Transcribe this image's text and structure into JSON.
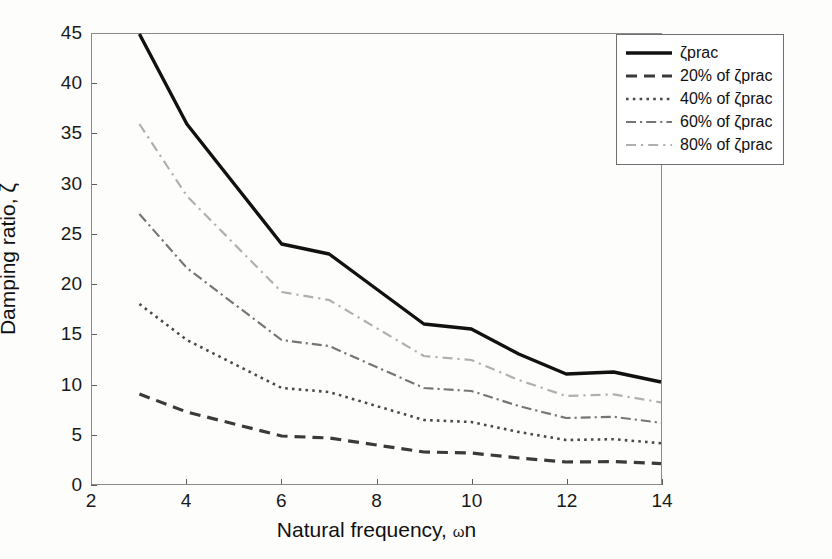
{
  "chart_data": {
    "type": "line",
    "title": "",
    "xlabel": "Natural frequency, ωn",
    "ylabel": "Damping ratio, ζ",
    "xlim": [
      2,
      14
    ],
    "ylim": [
      0,
      45
    ],
    "xticks": [
      2,
      4,
      6,
      8,
      10,
      12,
      14
    ],
    "yticks": [
      0,
      5,
      10,
      15,
      20,
      25,
      30,
      35,
      40,
      45
    ],
    "grid": false,
    "legend_position": "top-right",
    "x": [
      3,
      4,
      5,
      6,
      7,
      8,
      9,
      10,
      11,
      12,
      13,
      14
    ],
    "series": [
      {
        "name": "ζprac",
        "style": "solid",
        "color": "#111111",
        "width": 3.4,
        "values": [
          45,
          36,
          30,
          24,
          23,
          19.5,
          16,
          15.5,
          13,
          11,
          11.2,
          10.2
        ]
      },
      {
        "name": "20% of ζprac",
        "style": "dashed",
        "color": "#3a3a3a",
        "width": 3.2,
        "values": [
          9,
          7.2,
          6,
          4.8,
          4.6,
          3.9,
          3.2,
          3.1,
          2.6,
          2.2,
          2.24,
          2.04
        ]
      },
      {
        "name": "40% of ζprac",
        "style": "dotted",
        "color": "#4a4a4a",
        "width": 2.6,
        "values": [
          18,
          14.4,
          12,
          9.6,
          9.2,
          7.8,
          6.4,
          6.2,
          5.2,
          4.4,
          4.48,
          4.08
        ]
      },
      {
        "name": "60% of ζprac",
        "style": "dashdot",
        "color": "#767676",
        "width": 2.2,
        "values": [
          27,
          21.6,
          18,
          14.4,
          13.8,
          11.7,
          9.6,
          9.3,
          7.8,
          6.6,
          6.72,
          6.12
        ]
      },
      {
        "name": "80% of ζprac",
        "style": "dashdotlight",
        "color": "#b0b0b0",
        "width": 2.2,
        "values": [
          36,
          28.8,
          24,
          19.2,
          18.4,
          15.6,
          12.8,
          12.4,
          10.4,
          8.8,
          8.96,
          8.16
        ]
      }
    ]
  },
  "legend": {
    "items": [
      {
        "label": "ζprac"
      },
      {
        "label": "20% of  ζprac"
      },
      {
        "label": "40% of  ζprac"
      },
      {
        "label": "60% of  ζprac"
      },
      {
        "label": "80% of  ζprac"
      }
    ]
  },
  "axes": {
    "x_title": "Natural frequency, ωn",
    "y_title": "Damping ratio, ζ",
    "x_title_main": "Natural frequency, ",
    "x_title_omega": "ω",
    "x_title_n": "n",
    "y_title_main": "Damping ratio, ",
    "y_title_zeta": "ζ"
  }
}
